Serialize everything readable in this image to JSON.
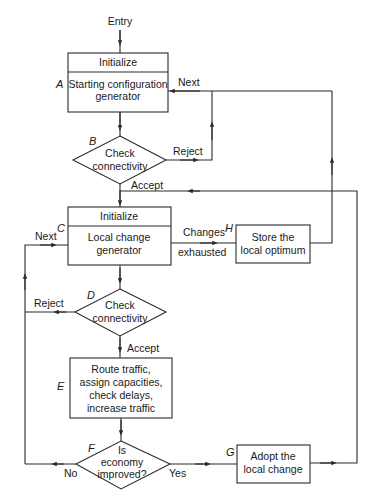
{
  "diagram": {
    "entry_label": "Entry",
    "nodes": {
      "A": {
        "tag": "A",
        "header": "Initialize",
        "lines": [
          "Starting configuration",
          "generator"
        ]
      },
      "B": {
        "tag": "B",
        "lines": [
          "Check",
          "connectivity"
        ]
      },
      "C": {
        "tag": "C",
        "header": "Initialize",
        "lines": [
          "Local change",
          "generator"
        ]
      },
      "D": {
        "tag": "D",
        "lines": [
          "Check",
          "connectivity"
        ]
      },
      "E": {
        "tag": "E",
        "lines": [
          "Route traffic,",
          "assign capacities,",
          "check delays,",
          "increase traffic"
        ]
      },
      "F": {
        "tag": "F",
        "lines": [
          "Is",
          "economy",
          "improved?"
        ]
      },
      "G": {
        "tag": "G",
        "lines": [
          "Adopt the",
          "local change"
        ]
      },
      "H": {
        "tag": "H",
        "lines": [
          "Store the",
          "local optimum"
        ]
      }
    },
    "edges": {
      "next_to_A": "Next",
      "B_reject": "Reject",
      "B_accept": "Accept",
      "next_to_C": "Next",
      "C_changes_exhausted": [
        "Changes",
        "exhausted"
      ],
      "D_reject": "Reject",
      "D_accept": "Accept",
      "F_no": "No",
      "F_yes": "Yes"
    }
  }
}
